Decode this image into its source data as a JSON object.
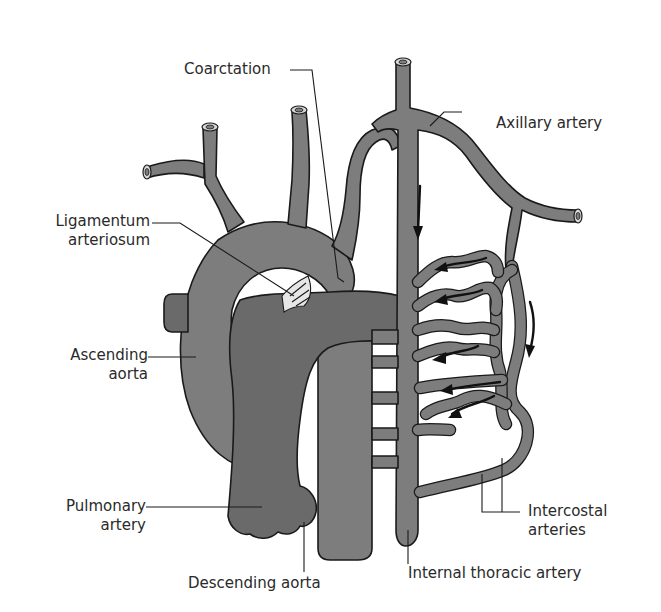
{
  "diagram": {
    "colors": {
      "vessel": "#7d7d7d",
      "pulmonary_artery": "#6a6a6a",
      "outline": "#1a1a1a",
      "ligament": "#e6e6e6",
      "background": "#ffffff",
      "text": "#2a2a2a"
    },
    "labels": {
      "coarctation": "Coarctation",
      "axillary_artery": "Axillary artery",
      "ligamentum_line1": "Ligamentum",
      "ligamentum_line2": "arteriosum",
      "ascending_line1": "Ascending",
      "ascending_line2": "aorta",
      "pulmonary_line1": "Pulmonary",
      "pulmonary_line2": "artery",
      "descending_aorta": "Descending aorta",
      "intercostal_line1": "Intercostal",
      "intercostal_line2": "arteries",
      "internal_thoracic_artery": "Internal thoracic artery"
    }
  }
}
